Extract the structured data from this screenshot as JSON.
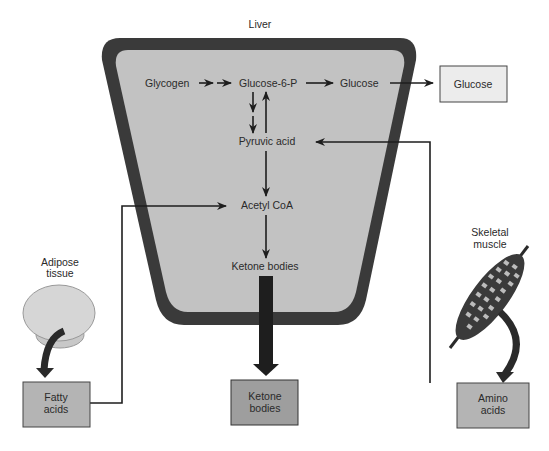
{
  "title": "Liver",
  "colors": {
    "liver_border": "#3a3a3a",
    "liver_fill": "#c2c2c2",
    "glucose_box": "#ececec",
    "box_fill": "#b4b4b4",
    "ketone_box": "#9e9e9e",
    "adipose_fill": "#d6d6d6",
    "arrow": "#1e1e1e",
    "text": "#2a2a2a"
  },
  "liver": {
    "nodes": {
      "glycogen": "Glycogen",
      "glucose6p": "Glucose-6-P",
      "glucose": "Glucose",
      "pyruvic": "Pyruvic acid",
      "acetyl": "Acetyl CoA",
      "ketone": "Ketone bodies"
    }
  },
  "external": {
    "glucose_box": "Glucose",
    "adipose": [
      "Adipose",
      "tissue"
    ],
    "fatty_acids": [
      "Fatty",
      "acids"
    ],
    "ketone_box": [
      "Ketone",
      "bodies"
    ],
    "skeletal": [
      "Skeletal",
      "muscle"
    ],
    "amino_acids": [
      "Amino",
      "acids"
    ]
  }
}
